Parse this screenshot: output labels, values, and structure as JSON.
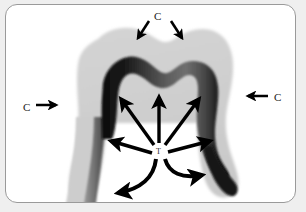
{
  "figure": {
    "type": "dental-anatomy-diagram",
    "background_color": "#ffffff",
    "frame_color": "#9a9a9a",
    "enamel_color": "#cfcfcf",
    "dentin_color": "#121212",
    "dentin_mid_color": "#6e6e6e",
    "arrow_color": "#000000"
  },
  "labels": {
    "c_top": "C",
    "c_left": "C",
    "c_right": "C",
    "t_center": "T"
  },
  "legend_meaning": {
    "c": "C",
    "t": "T"
  },
  "arrows": {
    "external": [
      {
        "name": "c-top-left-arrow",
        "label": "C",
        "direction": "down-right"
      },
      {
        "name": "c-top-right-arrow",
        "label": "C",
        "direction": "down-left"
      },
      {
        "name": "c-left-arrow",
        "label": "C",
        "direction": "right"
      },
      {
        "name": "c-right-arrow",
        "label": "C",
        "direction": "left"
      }
    ],
    "internal": [
      {
        "name": "t-arrow-up-left",
        "direction": "up-left",
        "style": "straight"
      },
      {
        "name": "t-arrow-up",
        "direction": "up",
        "style": "straight"
      },
      {
        "name": "t-arrow-up-right",
        "direction": "up-right",
        "style": "straight"
      },
      {
        "name": "t-arrow-left",
        "direction": "left",
        "style": "straight"
      },
      {
        "name": "t-arrow-right",
        "direction": "right",
        "style": "straight"
      },
      {
        "name": "t-arrow-down-left",
        "direction": "down-left",
        "style": "curved"
      },
      {
        "name": "t-arrow-down-right",
        "direction": "down-right",
        "style": "curved"
      }
    ]
  }
}
